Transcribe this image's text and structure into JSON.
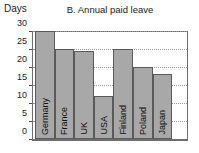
{
  "chart_data": {
    "type": "bar",
    "title": "B. Annual paid leave",
    "xlabel": "",
    "ylabel": "Days",
    "ylim": [
      0,
      30
    ],
    "yticks": [
      0,
      5,
      10,
      15,
      20,
      25,
      30
    ],
    "grid": true,
    "legend": null,
    "categories": [
      "Germany",
      "France",
      "UK",
      "USA",
      "Finland",
      "Poland",
      "Japan"
    ],
    "values": [
      30,
      25,
      24.5,
      12,
      25,
      20,
      18
    ],
    "bar_color": "#a8a8a8",
    "bar_edge_color": "#5a5a5a",
    "axis_color": "#6e6e6e",
    "grid_color": "#9a9a9a",
    "background": "#ffffff"
  }
}
